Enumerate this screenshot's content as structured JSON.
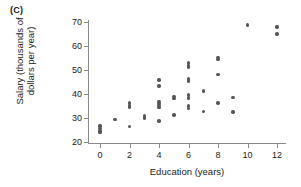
{
  "panel": {
    "label": "(C)"
  },
  "chart_data": {
    "type": "scatter",
    "title": "",
    "panel_label": "(C)",
    "xlabel": "Education (years)",
    "ylabel": "Salary (thousands of dollars per year)",
    "ylabel_line1": "Salary (thousands of",
    "ylabel_line2": "dollars per year)",
    "xlim": [
      -0.6,
      12.8
    ],
    "ylim": [
      20,
      71
    ],
    "xticks": [
      0,
      2,
      4,
      6,
      8,
      10,
      12
    ],
    "xtick_labels": [
      "0",
      "2",
      "4",
      "6",
      "8",
      "10",
      "12"
    ],
    "yticks": [
      20,
      30,
      40,
      50,
      60,
      70
    ],
    "ytick_labels": [
      "20",
      "30",
      "40",
      "50",
      "60",
      "70"
    ],
    "grid": false,
    "legend": null,
    "marker_color": "#575757",
    "axis_color": "#8a8a8a",
    "points": [
      {
        "x": 0,
        "y": 26.7
      },
      {
        "x": 0,
        "y": 25.6
      },
      {
        "x": 0,
        "y": 24.6
      },
      {
        "x": 0,
        "y": 23.9
      },
      {
        "x": 1,
        "y": 29.5
      },
      {
        "x": 2,
        "y": 36.2
      },
      {
        "x": 2,
        "y": 35.2
      },
      {
        "x": 2,
        "y": 34.6
      },
      {
        "x": 2,
        "y": 26.5
      },
      {
        "x": 3,
        "y": 30.9
      },
      {
        "x": 3,
        "y": 30.0
      },
      {
        "x": 4,
        "y": 45.8
      },
      {
        "x": 4,
        "y": 43.3
      },
      {
        "x": 4,
        "y": 37.0
      },
      {
        "x": 4,
        "y": 36.0
      },
      {
        "x": 4,
        "y": 35.2
      },
      {
        "x": 4,
        "y": 34.4
      },
      {
        "x": 4,
        "y": 28.8
      },
      {
        "x": 5,
        "y": 38.9
      },
      {
        "x": 5,
        "y": 38.1
      },
      {
        "x": 5,
        "y": 31.2
      },
      {
        "x": 6,
        "y": 53.0
      },
      {
        "x": 6,
        "y": 52.0
      },
      {
        "x": 6,
        "y": 51.2
      },
      {
        "x": 6,
        "y": 46.2
      },
      {
        "x": 6,
        "y": 45.4
      },
      {
        "x": 6,
        "y": 39.6
      },
      {
        "x": 6,
        "y": 38.3
      },
      {
        "x": 6,
        "y": 35.0
      },
      {
        "x": 6,
        "y": 34.1
      },
      {
        "x": 7,
        "y": 41.3
      },
      {
        "x": 7,
        "y": 32.8
      },
      {
        "x": 8,
        "y": 55.3
      },
      {
        "x": 8,
        "y": 54.4
      },
      {
        "x": 8,
        "y": 48.2
      },
      {
        "x": 8,
        "y": 36.2
      },
      {
        "x": 9,
        "y": 38.5
      },
      {
        "x": 9,
        "y": 32.5
      },
      {
        "x": 10,
        "y": 68.8
      },
      {
        "x": 12,
        "y": 67.9
      },
      {
        "x": 12,
        "y": 65.0
      }
    ]
  }
}
